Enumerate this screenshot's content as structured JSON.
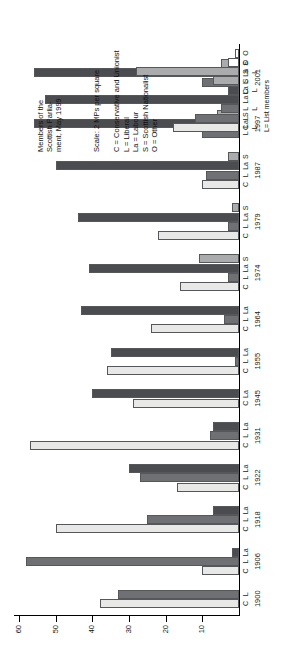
{
  "figure": {
    "title": "Members of the\nScottish Parlia-\nment, May 1999",
    "scale_note": "Scale: 2 MPs per square",
    "legend": "C = Conservative and Unionist\nL = Liberal\nLa = Labour\nS = Scottish Nationalist\nO = Other",
    "list_note": "L= List members",
    "colors": {
      "conservative": "#e8e8e6",
      "liberal": "#6e7073",
      "labour": "#4a4c4f",
      "nationalist": "#a9abac",
      "other": "#ffffff",
      "axis": "#000000"
    }
  },
  "chart_data": {
    "type": "bar",
    "xlabel": "",
    "ylabel": "",
    "ylim": [
      0,
      60
    ],
    "yticks": [
      10,
      20,
      30,
      40,
      50,
      60
    ],
    "ytick_labels": [
      "10",
      "20",
      "30",
      "40",
      "50",
      "60"
    ],
    "grid": false,
    "legend_position": "top-left",
    "party_keys": [
      "C",
      "L",
      "La",
      "S",
      "O"
    ],
    "party_names": {
      "C": "Conservative and Unionist",
      "L": "Liberal",
      "La": "Labour",
      "S": "Scottish Nationalist",
      "O": "Other"
    },
    "categories": [
      "1900",
      "1906",
      "1918",
      "1922",
      "1931",
      "1945",
      "1955",
      "1964",
      "1974",
      "1979",
      "1987",
      "1997",
      "2001"
    ],
    "groups": [
      {
        "year": "1900",
        "labels": [
          "C",
          "L"
        ],
        "values": [
          38,
          33
        ]
      },
      {
        "year": "1906",
        "labels": [
          "C",
          "L",
          "La"
        ],
        "values": [
          10,
          58,
          2
        ]
      },
      {
        "year": "1918",
        "labels": [
          "C",
          "L",
          "La"
        ],
        "values": [
          50,
          25,
          7
        ]
      },
      {
        "year": "1922",
        "labels": [
          "C",
          "L",
          "La"
        ],
        "values": [
          17,
          27,
          30
        ]
      },
      {
        "year": "1931",
        "labels": [
          "C",
          "L",
          "La"
        ],
        "values": [
          57,
          8,
          7
        ]
      },
      {
        "year": "1945",
        "labels": [
          "C",
          "La"
        ],
        "values": [
          29,
          40
        ]
      },
      {
        "year": "1955",
        "labels": [
          "C",
          "L",
          "La"
        ],
        "values": [
          36,
          1,
          35
        ]
      },
      {
        "year": "1964",
        "labels": [
          "C",
          "L",
          "La"
        ],
        "values": [
          24,
          4,
          43
        ]
      },
      {
        "year": "1974",
        "labels": [
          "C",
          "L",
          "La",
          "S"
        ],
        "values": [
          16,
          3,
          41,
          11
        ]
      },
      {
        "year": "1979",
        "labels": [
          "C",
          "L",
          "La",
          "S"
        ],
        "values": [
          22,
          3,
          44,
          2
        ]
      },
      {
        "year": "1987",
        "labels": [
          "C",
          "L",
          "La",
          "S"
        ],
        "values": [
          10,
          9,
          50,
          3
        ]
      },
      {
        "year": "1997",
        "labels": [
          "L",
          "La",
          "S"
        ],
        "values": [
          10,
          56,
          6
        ]
      },
      {
        "year": "2001",
        "labels": [
          "C",
          "L",
          "La",
          "S"
        ],
        "values": [
          1,
          10,
          56,
          5
        ]
      }
    ],
    "msp_panel": {
      "year": "1999",
      "labels": [
        "C",
        "L",
        "L",
        "La",
        "La",
        "S",
        "S",
        "O",
        "O"
      ],
      "sublabels": [
        "L",
        "",
        "L",
        "",
        "L",
        "",
        "L",
        "",
        ""
      ],
      "values": [
        18,
        12,
        5,
        53,
        3,
        7,
        28,
        3,
        1
      ],
      "parties": [
        "C",
        "L",
        "L",
        "La",
        "La",
        "S",
        "S",
        "O",
        "O"
      ]
    }
  }
}
